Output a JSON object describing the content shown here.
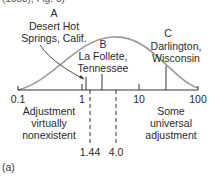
{
  "top_caption": "(1983), Fig. 5)",
  "diagram": {
    "type": "log-scale distribution curve",
    "axis": {
      "ticks": [
        "0.1",
        "1",
        "10",
        "100"
      ],
      "markers": [
        "1.44",
        "4.0"
      ]
    },
    "sites": [
      {
        "letter": "A",
        "name_line1": "Desert Hot",
        "name_line2": "Springs, Calif."
      },
      {
        "letter": "B",
        "name_line1": "La Follete,",
        "name_line2": "Tennessee"
      },
      {
        "letter": "C",
        "name_line1": "Darlington,",
        "name_line2": "Wisconsin"
      }
    ],
    "region_labels": {
      "left": [
        "Adjustment",
        "virtually",
        "nonexistent"
      ],
      "right": [
        "Some",
        "universal",
        "adjustment"
      ]
    },
    "colors": {
      "curve": "#9a9a9a",
      "lines": "#333333"
    }
  },
  "panel_label": "(a)"
}
